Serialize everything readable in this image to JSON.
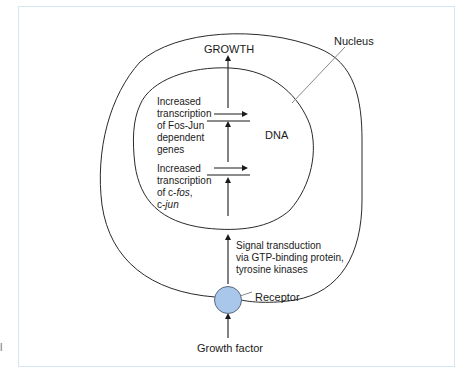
{
  "diagram": {
    "labels": {
      "growth": "GROWTH",
      "nucleus": "Nucleus",
      "dna": "DNA",
      "receptor": "Receptor",
      "growth_factor": "Growth factor"
    },
    "transcription_fos_jun": {
      "line1": "Increased",
      "line2": "transcription",
      "line3": "of Fos-Jun",
      "line4": "dependent",
      "line5": "genes"
    },
    "transcription_cfos_cjun": {
      "line1": "Increased",
      "line2": "transcription",
      "line3_prefix": "of c-",
      "line3_italic": "fos",
      "line3_suffix": ",",
      "line4_prefix": "c-",
      "line4_italic": "jun"
    },
    "signal_transduction": {
      "line1": "Signal transduction",
      "line2": "via GTP-binding protein,",
      "line3": "tyrosine kinases"
    },
    "stray_mark": "l",
    "colors": {
      "frame_border": "#d3e6f1",
      "receptor_fill": "#a9c7ea",
      "receptor_stroke": "#5a6b80",
      "line": "#2a2a2a",
      "leader_line": "#8a8a8a"
    }
  }
}
